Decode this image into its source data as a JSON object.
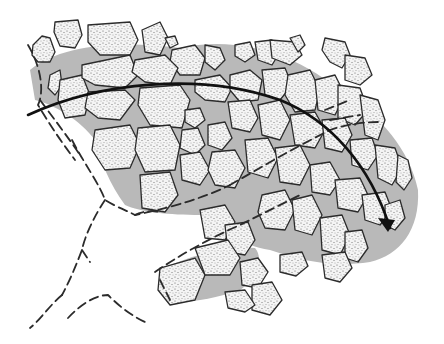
{
  "figure": {
    "type": "schematic illustration",
    "width": 444,
    "height": 344
  },
  "colors": {
    "background": "#ffffff",
    "matrix": "#b9b9b9",
    "block_fill": "#f4f4f4",
    "stipple_dot": "#5a5a5a",
    "outline": "#2b2b2b",
    "arrow": "#111111"
  },
  "matrix_regions": [
    "M30,70 C60,45 120,40 180,48 C240,35 300,55 345,95 C380,115 410,150 418,190 C420,230 400,255 370,262 C330,268 300,260 270,250 C240,245 220,230 200,215 C170,215 140,212 125,205 C110,185 100,160 95,140 C80,120 55,105 35,100 Z",
    "M160,270 C190,255 230,245 255,248 C265,260 255,280 240,290 C210,300 180,305 165,300 Z"
  ],
  "blocks": [
    "M33,45 L42,36 L50,38 L55,52 L50,62 L38,62 L32,55 Z",
    "M55,22 L78,20 L82,35 L75,48 L60,46 L54,32 Z",
    "M88,25 L130,22 L138,40 L130,55 L100,55 L88,42 Z",
    "M142,30 L160,22 L168,38 L160,55 L145,52 Z",
    "M165,38 L175,36 L178,44 L170,48 Z",
    "M172,50 L195,45 L205,58 L200,75 L180,75 L170,62 Z",
    "M205,45 L220,48 L225,60 L215,70 L205,62 Z",
    "M235,45 L250,42 L255,55 L245,62 L235,56 Z",
    "M255,42 L272,40 L280,52 L272,65 L258,60 Z",
    "M270,40 L295,42 L302,55 L290,65 L272,58 Z",
    "M290,38 L300,35 L305,45 L298,52 Z",
    "M325,38 L345,42 L350,55 L342,68 L330,62 L322,50 Z",
    "M345,55 L365,58 L372,75 L360,85 L345,80 Z",
    "M50,75 L60,70 L62,85 L55,95 L48,88 Z",
    "M60,80 L82,75 L90,95 L85,115 L65,118 L58,100 Z",
    "M82,65 L130,55 L138,75 L125,88 L95,85 L82,78 Z",
    "M135,60 L165,55 L178,68 L170,85 L145,82 L132,72 Z",
    "M88,92 L125,90 L135,100 L120,120 L98,118 L85,108 Z",
    "M140,88 L180,85 L190,100 L182,128 L150,125 L138,105 Z",
    "M195,80 L220,75 L232,88 L225,102 L205,100 L195,92 Z",
    "M230,75 L250,70 L262,80 L258,100 L240,102 L230,90 Z",
    "M262,70 L285,68 L292,85 L280,100 L265,95 Z",
    "M288,75 L310,70 L320,90 L315,110 L295,112 L285,95 Z",
    "M315,80 L335,75 L345,95 L335,115 L318,110 Z",
    "M338,85 L360,88 L368,110 L355,125 L338,118 Z",
    "M360,95 L378,100 L385,120 L378,140 L365,135 Z",
    "M95,130 L130,125 L140,145 L130,168 L105,170 L92,150 Z",
    "M138,128 L170,125 L180,145 L175,170 L145,172 L135,150 Z",
    "M185,110 L200,108 L205,120 L195,128 L185,122 Z",
    "M182,130 L198,128 L205,145 L195,155 L180,148 Z",
    "M208,125 L225,122 L232,138 L222,150 L208,145 Z",
    "M228,102 L250,100 L258,118 L250,132 L232,128 Z",
    "M258,105 L280,100 L290,120 L280,140 L262,135 Z",
    "M290,115 L315,112 L325,130 L315,148 L295,145 Z",
    "M322,120 L345,118 L352,135 L342,152 L325,148 Z",
    "M350,140 L372,138 L378,155 L368,170 L352,165 Z",
    "M375,145 L395,148 L402,168 L392,185 L378,178 Z",
    "M398,155 L408,160 L412,178 L404,190 L396,182 Z",
    "M180,155 L200,152 L210,170 L200,185 L182,180 Z",
    "M212,152 L235,150 L245,168 L235,188 L215,185 L208,170 Z",
    "M140,175 L170,172 L178,195 L165,212 L142,208 Z",
    "M245,140 L268,138 L278,158 L268,178 L248,172 Z",
    "M275,148 L300,145 L310,165 L300,185 L280,182 Z",
    "M310,165 L330,162 L340,180 L330,195 L312,192 Z",
    "M335,180 L360,178 L368,195 L358,212 L338,208 Z",
    "M362,195 L385,192 L392,210 L380,225 L365,220 Z",
    "M385,205 L400,200 L405,218 L395,230 L385,225 Z",
    "M262,195 L285,190 L295,210 L285,230 L265,228 L258,212 Z",
    "M292,200 L312,195 L322,215 L312,235 L295,230 Z",
    "M320,218 L342,215 L350,235 L340,255 L322,250 Z",
    "M345,232 L362,230 L368,248 L358,262 L345,258 Z",
    "M322,255 L345,252 L352,268 L340,282 L325,278 Z",
    "M200,210 L225,205 L235,222 L225,240 L205,238 Z",
    "M225,225 L248,222 L255,240 L245,255 L228,252 Z",
    "M160,268 L195,258 L205,275 L195,300 L170,305 L158,290 Z",
    "M195,248 L228,240 L240,258 L230,275 L205,275 Z",
    "M240,262 L258,258 L268,272 L258,288 L242,285 Z",
    "M280,255 L302,252 L308,266 L296,276 L280,272 Z",
    "M252,285 L272,282 L282,300 L270,315 L252,310 Z",
    "M225,292 L245,290 L255,305 L245,312 L228,308 Z"
  ],
  "dashed_boundaries": [
    "M28,45 C40,65 45,90 38,105 C50,125 60,140 75,160",
    "M40,100 C55,120 70,140 80,155",
    "M72,140 C85,165 100,185 105,200 C118,208 130,212 135,215 C160,210 200,200 230,185",
    "M105,200 C95,215 85,235 82,250 C75,268 70,280 62,295",
    "M82,250 L90,262 M62,295 C50,305 40,320 30,328",
    "M135,215 C140,212 150,210 160,212",
    "M230,185 C260,168 290,150 330,130 C345,125 360,122 380,122",
    "M325,110 L350,100 M330,120 L360,115",
    "M155,272 C180,255 210,238 240,225 C260,215 280,205 300,195",
    "M160,280 L170,300",
    "M68,318 C80,305 95,295 108,295 C118,305 130,315 145,322"
  ],
  "arrow": {
    "path": "M28,115 C100,82 200,72 280,100 C330,120 370,165 390,228",
    "head": "M388,232 L378,218 L395,220 Z",
    "direction": "left-to-right curving downward"
  }
}
